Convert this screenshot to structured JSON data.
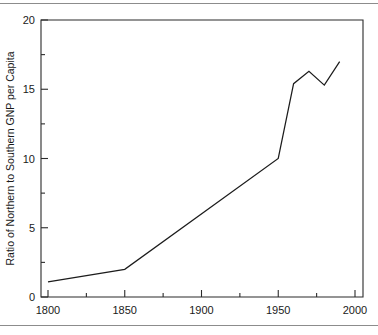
{
  "figure": {
    "background_color": "#ffffff",
    "rule_color": "#8c8c8c",
    "has_top_rule": true,
    "has_bottom_rule": true
  },
  "chart_data": {
    "type": "line",
    "title": "",
    "subtitle": "",
    "xlabel": "",
    "ylabel": "Ratio of Northern to Southern GNP per Capita",
    "xlim": [
      1800,
      2000
    ],
    "ylim": [
      0,
      20
    ],
    "grid": false,
    "legend": false,
    "legend_position": "none",
    "line_color": "#1c1c1c",
    "axis_color": "#2b2b2b",
    "x_ticks": [
      1800,
      1850,
      1900,
      1950,
      2000
    ],
    "x_tick_labels": [
      "1800",
      "1850",
      "1900",
      "1950",
      "2000"
    ],
    "x_minor_ticks": [
      1825,
      1875,
      1925,
      1975
    ],
    "y_ticks": [
      0,
      5,
      10,
      15,
      20
    ],
    "y_tick_labels": [
      "0",
      "5",
      "10",
      "15",
      "20"
    ],
    "y_minor_ticks": [
      2.5,
      7.5,
      12.5,
      17.5
    ],
    "series": [
      {
        "name": "Ratio of Northern to Southern GNP per Capita",
        "x": [
          1800,
          1850,
          1950,
          1960,
          1970,
          1980,
          1990
        ],
        "values": [
          1.1,
          2.0,
          10.0,
          15.4,
          16.3,
          15.3,
          17.0
        ]
      }
    ]
  }
}
